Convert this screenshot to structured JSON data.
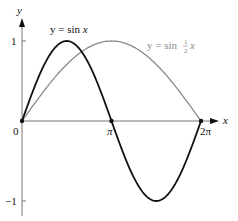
{
  "chart_data": {
    "type": "line",
    "title": "",
    "xlabel": "x",
    "ylabel": "y",
    "xlim": [
      0,
      6.2832
    ],
    "ylim": [
      -1,
      1
    ],
    "grid": false,
    "legend": "inline labels",
    "x_ticks": [
      {
        "value": 0,
        "label": "0"
      },
      {
        "value": 3.1416,
        "label": "π"
      },
      {
        "value": 6.2832,
        "label": "2π"
      }
    ],
    "y_ticks": [
      {
        "value": 1,
        "label": "1"
      },
      {
        "value": -1,
        "label": "−1"
      }
    ],
    "series": [
      {
        "name": "y = sin x",
        "function": "sin(x)",
        "color": "#111111",
        "x": [
          0,
          0.7854,
          1.5708,
          2.3562,
          3.1416,
          3.927,
          4.7124,
          5.4978,
          6.2832
        ],
        "values": [
          0,
          0.707,
          1,
          0.707,
          0,
          -0.707,
          -1,
          -0.707,
          0
        ]
      },
      {
        "name": "y = sin ½x",
        "function": "sin(x/2)",
        "color": "#8a8a8a",
        "x": [
          0,
          0.7854,
          1.5708,
          2.3562,
          3.1416,
          3.927,
          4.7124,
          5.4978,
          6.2832
        ],
        "values": [
          0,
          0.383,
          0.707,
          0.924,
          1,
          0.924,
          0.707,
          0.383,
          0
        ]
      }
    ],
    "marked_points": [
      {
        "x": 0,
        "y": 0
      },
      {
        "x": 3.1416,
        "y": 0
      },
      {
        "x": 6.2832,
        "y": 0
      }
    ],
    "annotations": [
      {
        "text": "y = sin x",
        "series": 0
      },
      {
        "text_parts": [
          "y = sin ",
          "1",
          "2",
          "x"
        ],
        "series": 1
      }
    ]
  },
  "labels": {
    "y_axis": "y",
    "x_axis": "x",
    "origin": "0",
    "pi": "π",
    "two_pi": "2π",
    "y_one": "1",
    "y_neg_one": "−1",
    "sin_x_prefix": "y = sin ",
    "sin_x_var": "x",
    "sin_half_prefix": "y = sin ",
    "half_num": "1",
    "half_den": "2",
    "sin_half_var": "x"
  }
}
